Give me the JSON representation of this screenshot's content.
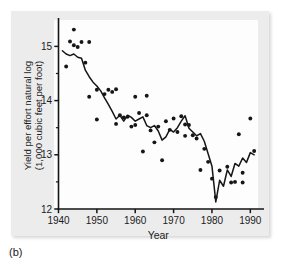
{
  "figure": {
    "caption": "(b)",
    "panel_color": "#ececed",
    "canvas_color": "#fdfdfd",
    "ink_color": "#161616"
  },
  "chart_data": {
    "type": "scatter",
    "title": "",
    "xlabel": "Year",
    "ylabel": "Yield per effort natural log (1,000 cubic feet per foot)",
    "ylabel_line1": "Yield per effort natural log",
    "ylabel_line2": "(1,000 cubic feet per foot)",
    "xlim": [
      1940,
      1992
    ],
    "ylim": [
      12,
      15.45
    ],
    "xticks": [
      1940,
      1950,
      1960,
      1970,
      1980,
      1990
    ],
    "xticklabels": [
      "1940",
      "1950",
      "1960",
      "1970",
      "1980",
      "1990"
    ],
    "yticks": [
      12,
      13,
      14,
      15
    ],
    "yticklabels": [
      "12",
      "13",
      "14",
      "15"
    ],
    "yminorticks": [
      12.5,
      13.5,
      14.5
    ],
    "grid": false,
    "legend": false,
    "series": [
      {
        "name": "Observed yield per effort",
        "type": "scatter",
        "marker": "filled-circle",
        "color": "#161616",
        "x": [
          1942,
          1943,
          1944,
          1944,
          1945,
          1946,
          1947,
          1948,
          1948,
          1950,
          1950,
          1952,
          1953,
          1954,
          1955,
          1955,
          1956,
          1957,
          1958,
          1959,
          1960,
          1960,
          1961,
          1962,
          1963,
          1963,
          1964,
          1965,
          1966,
          1967,
          1968,
          1969,
          1970,
          1971,
          1972,
          1973,
          1973,
          1974,
          1975,
          1976,
          1977,
          1978,
          1979,
          1980,
          1981,
          1982,
          1984,
          1985,
          1986,
          1987,
          1988,
          1988,
          1990,
          1991
        ],
        "y": [
          14.63,
          15.09,
          15.31,
          15.02,
          14.99,
          15.08,
          14.7,
          15.08,
          14.07,
          14.2,
          13.65,
          14.12,
          14.2,
          14.16,
          14.21,
          13.57,
          13.73,
          13.69,
          13.7,
          13.52,
          14.07,
          13.55,
          13.77,
          13.06,
          14.09,
          13.73,
          13.45,
          13.23,
          13.52,
          12.9,
          13.62,
          13.46,
          13.67,
          13.42,
          13.71,
          13.56,
          13.35,
          13.55,
          13.36,
          13.3,
          12.72,
          13.11,
          12.87,
          12.56,
          12.22,
          12.71,
          12.78,
          12.49,
          12.5,
          13.38,
          12.67,
          12.49,
          13.67,
          13.07
        ]
      },
      {
        "name": "Smoothed trend line",
        "type": "line",
        "color": "#161616",
        "x": [
          1941,
          1942,
          1943,
          1944,
          1945,
          1946,
          1947,
          1948,
          1949,
          1950,
          1951,
          1952,
          1953,
          1954,
          1955,
          1956,
          1957,
          1958,
          1959,
          1960,
          1961,
          1962,
          1963,
          1964,
          1965,
          1966,
          1967,
          1968,
          1969,
          1970,
          1971,
          1972,
          1973,
          1974,
          1975,
          1976,
          1977,
          1978,
          1979,
          1980,
          1981,
          1982,
          1983,
          1984,
          1985,
          1986,
          1987,
          1988,
          1989,
          1990,
          1991
        ],
        "y": [
          14.92,
          14.86,
          14.83,
          14.86,
          14.8,
          14.78,
          14.56,
          14.44,
          14.34,
          14.27,
          14.18,
          14.05,
          13.93,
          13.8,
          13.66,
          13.73,
          13.62,
          13.73,
          13.69,
          13.62,
          13.66,
          13.7,
          13.54,
          13.5,
          13.54,
          13.44,
          13.27,
          13.33,
          13.47,
          13.42,
          13.5,
          13.62,
          13.72,
          13.49,
          13.42,
          13.35,
          13.39,
          13.25,
          13.02,
          12.79,
          12.13,
          12.53,
          12.42,
          12.72,
          12.6,
          12.84,
          12.79,
          12.94,
          12.86,
          13.04,
          13.0
        ]
      }
    ]
  }
}
